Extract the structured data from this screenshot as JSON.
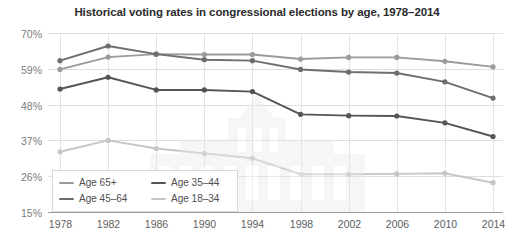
{
  "chart_data": {
    "type": "line",
    "title": "Historical voting rates in congressional elections by age, 1978–2014",
    "xlabel": "",
    "ylabel": "",
    "categories": [
      1978,
      1982,
      1986,
      1990,
      1994,
      1998,
      2002,
      2006,
      2010,
      2014
    ],
    "x_tick_labels": [
      "1978",
      "1982",
      "1986",
      "1990",
      "1994",
      "1998",
      "2002",
      "2006",
      "2010",
      "2014"
    ],
    "y_tick_labels": [
      "70%",
      "59%",
      "48%",
      "37%",
      "26%",
      "15%"
    ],
    "y_tick_values": [
      70,
      59,
      48,
      37,
      26,
      15
    ],
    "ylim": [
      15,
      70
    ],
    "grid": true,
    "legend_position": "inside-bottom-left",
    "series": [
      {
        "name": "Age 65+",
        "color": "#9b9b9b",
        "values": [
          58.8,
          62.6,
          63.5,
          63.4,
          63.4,
          62.0,
          62.5,
          62.5,
          61.3,
          59.6
        ]
      },
      {
        "name": "Age 45–64",
        "color": "#6e6e6e",
        "values": [
          61.5,
          66.0,
          63.5,
          61.8,
          61.5,
          58.8,
          58.0,
          57.7,
          55.0,
          50.0
        ]
      },
      {
        "name": "Age 35–44",
        "color": "#555555",
        "values": [
          52.8,
          56.4,
          52.5,
          52.5,
          52.0,
          45.0,
          44.6,
          44.5,
          42.4,
          38.2
        ]
      },
      {
        "name": "Age 18–34",
        "color": "#c6c6c6",
        "values": [
          33.5,
          37.0,
          34.5,
          33.0,
          31.5,
          26.6,
          26.6,
          26.7,
          26.9,
          24.0
        ]
      }
    ]
  },
  "legend": {
    "rows": [
      [
        {
          "label": "Age 65+",
          "color": "#9b9b9b"
        },
        {
          "label": "Age 35–44",
          "color": "#555555"
        }
      ],
      [
        {
          "label": "Age 45–64",
          "color": "#6e6e6e"
        },
        {
          "label": "Age 18–34",
          "color": "#c6c6c6"
        }
      ]
    ]
  }
}
